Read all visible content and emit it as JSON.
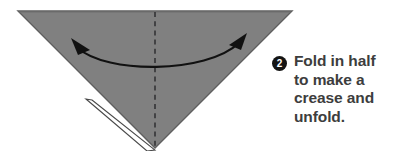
{
  "diagram": {
    "shape": {
      "name": "downward-pointing-triangle",
      "fill_color": "#808080",
      "edge_color": "#5a5a5a",
      "points": "18,11 292,11 155,148",
      "under_layer_color": "#ffffff",
      "under_layer_points": "97,102 155,149 149,150 92,101"
    },
    "crease_line": {
      "name": "vertical-dashed-crease",
      "color": "#3a3a3a",
      "x": 155,
      "y_start": 12,
      "y_end": 148,
      "dash": "5,4"
    },
    "arrow": {
      "name": "double-headed-fold-arrow",
      "color": "#111111",
      "path": "M 76,47 C 104,72 208,72 240,42",
      "left_head": "74,40 90,52 78,54",
      "right_head": "245,35 232,46 243,50",
      "stroke_width": 2.1
    }
  },
  "instruction": {
    "step_number": "2",
    "lines": [
      "Fold in half",
      "to make a",
      "crease and",
      "unfold."
    ],
    "full_text": "Fold in half to make a crease and unfold.",
    "text_color": "#3d3d3d",
    "badge_color": "#141414"
  }
}
